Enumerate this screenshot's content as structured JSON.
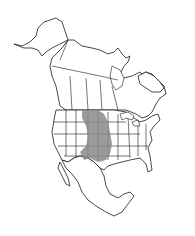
{
  "map": {
    "subject": "North America range map",
    "regions": [
      "Canada",
      "United States",
      "Mexico"
    ],
    "style": "black outline with state/province boundaries",
    "range_color": "#8a8a8a",
    "outline_color": "#1a1a1a",
    "background_color": "#ffffff",
    "shaded_range": {
      "label": "Great Plains distribution",
      "approx_area": "from southern Canadian prairies south through central US plains to northern Mexico border"
    }
  }
}
